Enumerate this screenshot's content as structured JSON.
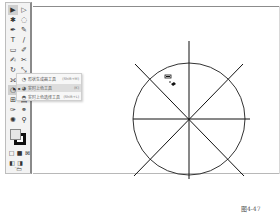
{
  "toolbar": {
    "tools": [
      {
        "name": "selection-tool",
        "glyph": "▶",
        "selected": true
      },
      {
        "name": "direct-selection-tool",
        "glyph": "▷"
      },
      {
        "name": "magic-wand-tool",
        "glyph": "✱"
      },
      {
        "name": "lasso-tool",
        "glyph": "◌"
      },
      {
        "name": "pen-tool",
        "glyph": "✒"
      },
      {
        "name": "curvature-tool",
        "glyph": "✎"
      },
      {
        "name": "type-tool",
        "glyph": "T"
      },
      {
        "name": "line-tool",
        "glyph": "/"
      },
      {
        "name": "rectangle-tool",
        "glyph": "▭"
      },
      {
        "name": "paintbrush-tool",
        "glyph": "✐"
      },
      {
        "name": "shaper-tool",
        "glyph": "✍"
      },
      {
        "name": "eraser-tool",
        "glyph": "✂"
      },
      {
        "name": "rotate-tool",
        "glyph": "↻"
      },
      {
        "name": "scale-tool",
        "glyph": "⤡"
      },
      {
        "name": "width-tool",
        "glyph": "⟗"
      },
      {
        "name": "free-transform-tool",
        "glyph": "⬚"
      },
      {
        "name": "shape-builder-tool",
        "glyph": "◔"
      },
      {
        "name": "perspective-grid-tool",
        "glyph": "▦"
      },
      {
        "name": "mesh-tool",
        "glyph": "⊞"
      },
      {
        "name": "gradient-tool",
        "glyph": "▤"
      },
      {
        "name": "eyedropper-tool",
        "glyph": "✑"
      },
      {
        "name": "blend-tool",
        "glyph": "⚭"
      },
      {
        "name": "symbol-sprayer-tool",
        "glyph": "✺"
      },
      {
        "name": "column-graph-tool",
        "glyph": "▥"
      },
      {
        "name": "artboard-tool",
        "glyph": "⊡"
      },
      {
        "name": "slice-tool",
        "glyph": "✄"
      },
      {
        "name": "hand-tool",
        "glyph": "✋"
      },
      {
        "name": "zoom-tool",
        "glyph": "⚲"
      }
    ],
    "color_modes": [
      "□",
      "■",
      "⊠"
    ],
    "draw_modes": [
      "◧",
      "◨"
    ],
    "screen_mode": "▭",
    "more": "···"
  },
  "flyout": {
    "items": [
      {
        "icon": "◔",
        "label": "形状生成器工具",
        "shortcut": "(Shift+M)",
        "active": false,
        "bullet": ""
      },
      {
        "icon": "◕",
        "label": "实时上色工具",
        "shortcut": "(K)",
        "active": true,
        "bullet": "▪"
      },
      {
        "icon": "◓",
        "label": "实时上色选择工具",
        "shortcut": "(Shift+L)",
        "active": false,
        "bullet": ""
      }
    ]
  },
  "canvas": {
    "circle": {
      "cx": 187,
      "cy": 119,
      "r": 56,
      "stroke": "#333333"
    },
    "line_color": "#111111"
  },
  "caption": "图4-47"
}
